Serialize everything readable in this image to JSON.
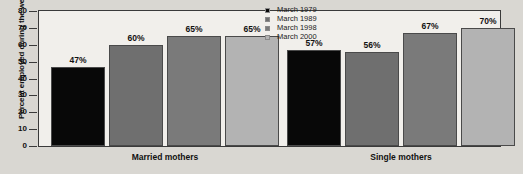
{
  "chart_data": {
    "type": "bar",
    "title": "",
    "xlabel": "",
    "ylabel": "Percent employed during the week",
    "ylim": [
      0,
      80
    ],
    "yticks": [
      "0",
      "10",
      "20",
      "30",
      "40",
      "50",
      "60",
      "70",
      "80"
    ],
    "grid": false,
    "legend_position": "top-right",
    "categories": [
      "Married mothers",
      "Single mothers"
    ],
    "series": [
      {
        "name": "March 1979",
        "color": "#080808",
        "values": [
          47,
          57
        ],
        "labels": [
          "47%",
          "57%"
        ]
      },
      {
        "name": "March 1989",
        "color": "#6f6f6f",
        "values": [
          60,
          56
        ],
        "labels": [
          "60%",
          "56%"
        ]
      },
      {
        "name": "March 1998",
        "color": "#7a7a7a",
        "values": [
          65,
          67
        ],
        "labels": [
          "65%",
          "67%"
        ]
      },
      {
        "name": "March 2000",
        "color": "#b3b3b3",
        "values": [
          65,
          70
        ],
        "labels": [
          "65%",
          "70%"
        ]
      }
    ]
  },
  "legend": {
    "items": [
      {
        "label": "March 1979",
        "color": "#080808"
      },
      {
        "label": "March 1989",
        "color": "#6f6f6f"
      },
      {
        "label": "March 1998",
        "color": "#7a7a7a"
      },
      {
        "label": "March 2000",
        "color": "#b3b3b3"
      }
    ]
  },
  "axis": {
    "y_title": "Percent employed during the week",
    "y_ticks": [
      "80",
      "70",
      "60",
      "50",
      "40",
      "30",
      "20",
      "10",
      "0"
    ]
  },
  "groups": [
    {
      "label": "Married mothers"
    },
    {
      "label": "Single mothers"
    }
  ]
}
